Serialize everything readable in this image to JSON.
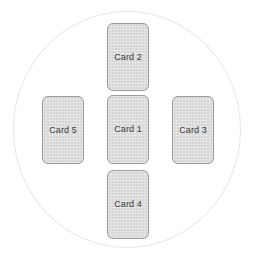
{
  "canvas": {
    "width": 254,
    "height": 259,
    "background_color": "#ffffff"
  },
  "boundary": {
    "shape": "circle",
    "stroke_color": "#e6e6e6",
    "center_x": 127,
    "center_y": 130,
    "radius": 114
  },
  "layout": {
    "arrangement": "cross",
    "card_fill_color": "#d6d6d6",
    "card_border_color": "#9a9a9a",
    "card_text_color": "#3a3a3a"
  },
  "cards": [
    {
      "id": "card-1",
      "label": "Card 1",
      "position": "center",
      "x": 107,
      "y": 95,
      "width": 42,
      "height": 69
    },
    {
      "id": "card-2",
      "label": "Card 2",
      "position": "top",
      "x": 107,
      "y": 23,
      "width": 42,
      "height": 68
    },
    {
      "id": "card-3",
      "label": "Card 3",
      "position": "right",
      "x": 172,
      "y": 96,
      "width": 42,
      "height": 68
    },
    {
      "id": "card-4",
      "label": "Card 4",
      "position": "bottom",
      "x": 107,
      "y": 170,
      "width": 42,
      "height": 69
    },
    {
      "id": "card-5",
      "label": "Card 5",
      "position": "left",
      "x": 42,
      "y": 96,
      "width": 42,
      "height": 68
    }
  ]
}
